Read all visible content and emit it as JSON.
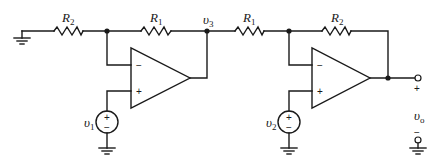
{
  "diagram": {
    "type": "circuit",
    "labels": {
      "r2_left": {
        "main": "R",
        "sub": "2"
      },
      "r1_left": {
        "main": "R",
        "sub": "1"
      },
      "v3": {
        "main": "υ",
        "sub": "3"
      },
      "r1_right": {
        "main": "R",
        "sub": "1"
      },
      "r2_right": {
        "main": "R",
        "sub": "2"
      },
      "v1": {
        "main": "υ",
        "sub": "1"
      },
      "v2": {
        "main": "υ",
        "sub": "2"
      },
      "vo": {
        "main": "υ",
        "sub": "o"
      }
    },
    "opamp1": {
      "minus": "−",
      "plus": "+"
    },
    "opamp2": {
      "minus": "−",
      "plus": "+"
    },
    "source1": {
      "plus": "+",
      "minus": "−"
    },
    "source2": {
      "plus": "+",
      "minus": "−"
    },
    "output": {
      "plus": "+",
      "minus": "−"
    }
  }
}
